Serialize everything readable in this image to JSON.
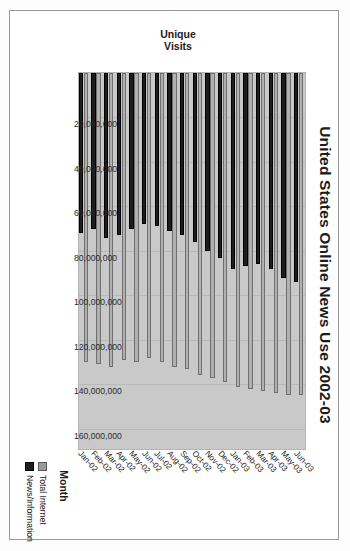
{
  "chart_data": {
    "type": "bar",
    "orientation": "horizontal",
    "title": "United States Online News Use 2002-03",
    "xlabel": "Month",
    "ylabel": "Unique Visits",
    "categories": [
      "Jan-02",
      "Feb-02",
      "Mar-02",
      "Apr-02",
      "May-02",
      "Jun-02",
      "Jul-02",
      "Aug-02",
      "Sep-02",
      "Oct-02",
      "Nov-02",
      "Dec-02",
      "Jan-03",
      "Feb-03",
      "Mar-03",
      "Apr-03",
      "May-03",
      "Jun-03"
    ],
    "value_ticks": [
      "160,000,000",
      "140,000,000",
      "120,000,000",
      "100,000,000",
      "80,000,000",
      "60,000,000",
      "40,000,000",
      "20,000,000"
    ],
    "value_tick_numbers": [
      160000000,
      140000000,
      120000000,
      100000000,
      80000000,
      60000000,
      40000000,
      20000000
    ],
    "ylim": [
      0,
      170000000
    ],
    "grid": true,
    "legend_position": "bottom-right",
    "series": [
      {
        "name": "Total Internet",
        "color": "#b0b0b0",
        "values": [
          130000000,
          131000000,
          132000000,
          129000000,
          130000000,
          128000000,
          130000000,
          132000000,
          133000000,
          136000000,
          137000000,
          139000000,
          141000000,
          142000000,
          143000000,
          144000000,
          145000000,
          145000000
        ]
      },
      {
        "name": "News/Information",
        "color": "#1d1d1d",
        "values": [
          72000000,
          70000000,
          74000000,
          73000000,
          70000000,
          68000000,
          69000000,
          71000000,
          73000000,
          76000000,
          80000000,
          83000000,
          88000000,
          87000000,
          86000000,
          88000000,
          92000000,
          94000000
        ]
      }
    ]
  },
  "legend": {
    "items": [
      {
        "label": "Total Internet"
      },
      {
        "label": "News/Information"
      }
    ]
  }
}
